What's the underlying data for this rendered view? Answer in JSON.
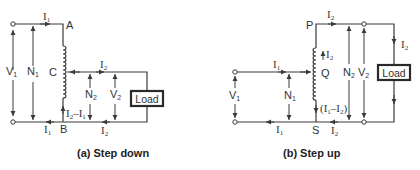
{
  "figure_a": {
    "caption": "(a) Step down",
    "nodes": {
      "top": "A",
      "tap": "C",
      "bottom": "B"
    },
    "labels": {
      "v1": "V",
      "v1_sub": "1",
      "n1": "N",
      "n1_sub": "1",
      "n2": "N",
      "n2_sub": "2",
      "v2": "V",
      "v2_sub": "2",
      "i1_top": "I",
      "i1_top_sub": "1",
      "i2_tap": "I",
      "i2_tap_sub": "2",
      "i1_bottom": "I",
      "i1_bottom_sub": "1",
      "i2_bottom": "I",
      "i2_bottom_sub": "2",
      "coil_current": "I",
      "coil_current_sub1": "2",
      "coil_current_mid": "–I",
      "coil_current_sub2": "1"
    },
    "load": "Load"
  },
  "figure_b": {
    "caption": "(b) Step up",
    "nodes": {
      "top": "P",
      "tap": "Q",
      "bottom": "S"
    },
    "labels": {
      "v1": "V",
      "v1_sub": "1",
      "n1": "N",
      "n1_sub": "1",
      "n2": "N",
      "n2_sub": "2",
      "v2": "V",
      "v2_sub": "2",
      "i2_top": "I",
      "i2_top_sub": "2",
      "i2_coil": "I",
      "i2_coil_sub": "2",
      "i2_load": "I",
      "i2_load_sub": "2",
      "i1_input": "I",
      "i1_input_sub": "1",
      "i1_bottom": "I",
      "i1_bottom_sub": "1",
      "i2_bottom": "I",
      "i2_bottom_sub": "2",
      "coil_current": "(I",
      "coil_current_sub1": "1",
      "coil_current_mid": "–I",
      "coil_current_sub2": "2",
      "coil_current_end": ")"
    },
    "load": "Load"
  }
}
